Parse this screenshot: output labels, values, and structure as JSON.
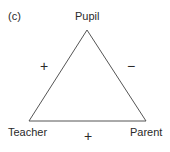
{
  "panel_label": "(c)",
  "nodes": {
    "top": "Pupil",
    "bottom_left": "Teacher",
    "bottom_right": "Parent"
  },
  "edges": {
    "left": {
      "between": [
        "Pupil",
        "Teacher"
      ],
      "sign": "+"
    },
    "right": {
      "between": [
        "Pupil",
        "Parent"
      ],
      "sign": "−"
    },
    "bottom": {
      "between": [
        "Teacher",
        "Parent"
      ],
      "sign": "+"
    }
  },
  "colors": {
    "line": "#555555",
    "text": "#2a2a2a"
  }
}
